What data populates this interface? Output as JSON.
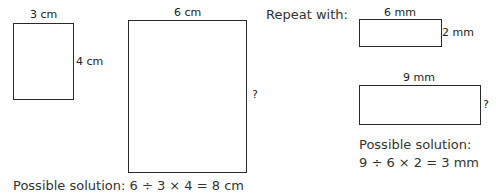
{
  "left_example": {
    "small_rect": {
      "width_label": "3 cm",
      "height_label": "4 cm"
    },
    "large_rect": {
      "width_label": "6 cm",
      "height_label": "?"
    },
    "solution": "Possible solution: 6 ÷ 3 × 4 = 8 cm"
  },
  "right_example": {
    "heading": "Repeat with:",
    "small_rect": {
      "width_label": "6 mm",
      "height_label": "2 mm"
    },
    "large_rect": {
      "width_label": "9 mm",
      "height_label": "?"
    },
    "solution_line1": "Possible solution:",
    "solution_line2": "9 ÷ 6 × 2 = 3 mm"
  }
}
